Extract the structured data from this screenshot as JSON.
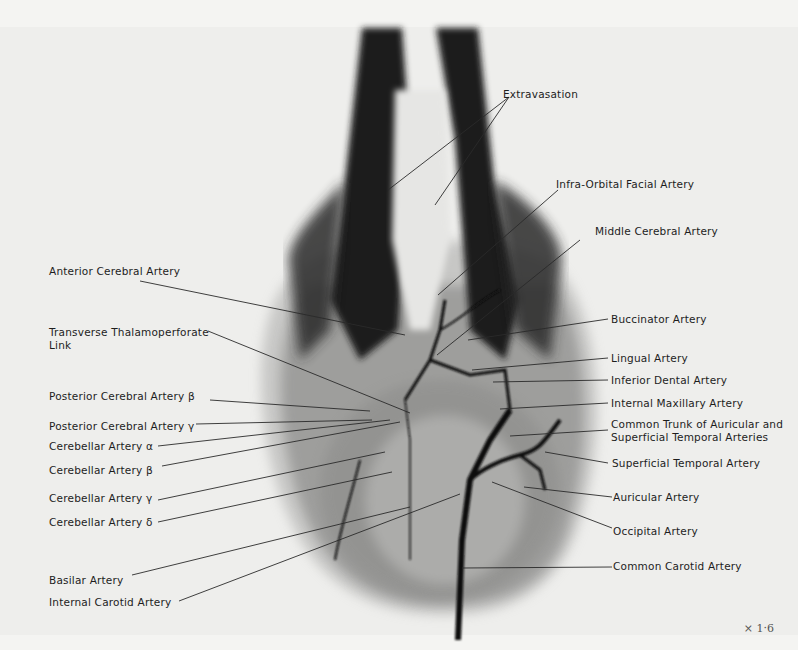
{
  "figure": {
    "type": "radiograph-angiogram",
    "magnification": "× 1·6",
    "labels_left": [
      {
        "id": "anterior-cerebral-artery",
        "text": "Anterior Cerebral Artery"
      },
      {
        "id": "transverse-thalamoperforate-link",
        "text": "Transverse Thalamoperforate Link"
      },
      {
        "id": "posterior-cerebral-artery-beta",
        "text": "Posterior Cerebral Artery β"
      },
      {
        "id": "posterior-cerebral-artery-gamma",
        "text": "Posterior Cerebral Artery γ"
      },
      {
        "id": "cerebellar-artery-alpha",
        "text": "Cerebellar Artery α"
      },
      {
        "id": "cerebellar-artery-beta",
        "text": "Cerebellar Artery β"
      },
      {
        "id": "cerebellar-artery-gamma",
        "text": "Cerebellar Artery γ"
      },
      {
        "id": "cerebellar-artery-delta",
        "text": "Cerebellar Artery δ"
      },
      {
        "id": "basilar-artery",
        "text": "Basilar Artery"
      },
      {
        "id": "internal-carotid-artery",
        "text": "Internal Carotid Artery"
      }
    ],
    "labels_right": [
      {
        "id": "extravasation",
        "text": "Extravasation"
      },
      {
        "id": "infra-orbital-facial-artery",
        "text": "Infra-Orbital Facial Artery"
      },
      {
        "id": "middle-cerebral-artery",
        "text": "Middle Cerebral Artery"
      },
      {
        "id": "buccinator-artery",
        "text": "Buccinator Artery"
      },
      {
        "id": "lingual-artery",
        "text": "Lingual Artery"
      },
      {
        "id": "inferior-dental-artery",
        "text": "Inferior Dental Artery"
      },
      {
        "id": "internal-maxillary-artery",
        "text": "Internal Maxillary Artery"
      },
      {
        "id": "common-trunk",
        "text": "Common Trunk of Auricular and Superficial Temporal Arteries"
      },
      {
        "id": "superficial-temporal-artery",
        "text": "Superficial Temporal Artery"
      },
      {
        "id": "auricular-artery",
        "text": "Auricular Artery"
      },
      {
        "id": "occipital-artery",
        "text": "Occipital Artery"
      },
      {
        "id": "common-carotid-artery",
        "text": "Common Carotid Artery"
      }
    ]
  }
}
